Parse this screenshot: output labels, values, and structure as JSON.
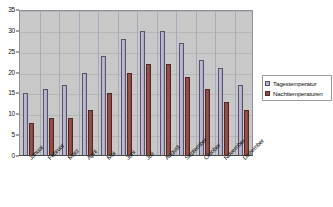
{
  "chart_data": {
    "type": "bar",
    "title": "",
    "subtitle": "",
    "xlabel": "",
    "ylabel": "",
    "ylim": [
      0,
      35
    ],
    "ytick_step": 5,
    "yticks": [
      0,
      5,
      10,
      15,
      20,
      25,
      30,
      35
    ],
    "grid": true,
    "legend_position": "right",
    "categories": [
      "Januar",
      "Februar",
      "März",
      "April",
      "Mai",
      "Juni",
      "Juli",
      "August",
      "September",
      "Oktober",
      "November",
      "Dezember"
    ],
    "series": [
      {
        "name": "Tagestemperatur",
        "color": "#b9b0cd",
        "values": [
          15,
          16,
          17,
          20,
          24,
          28,
          30,
          30,
          27,
          23,
          21,
          17
        ]
      },
      {
        "name": "Nachttemperaturen",
        "color": "#8f4a43",
        "values": [
          8,
          9,
          9,
          11,
          15,
          20,
          22,
          22,
          19,
          16,
          13,
          11
        ]
      }
    ]
  },
  "legend": {
    "items": [
      {
        "label": "Tagestemperatur",
        "swatch": "day"
      },
      {
        "label": "Nachttemperaturen",
        "swatch": "night"
      }
    ]
  },
  "colors": {
    "plot_background": "#c8c8c8",
    "plot_border": "#8e8e9e",
    "gridline": "#b6b6b6",
    "axis": "#4a4a4a",
    "day_bar": "#b9b0cd",
    "night_bar": "#8f4a43",
    "page_background": "#ffffff"
  }
}
